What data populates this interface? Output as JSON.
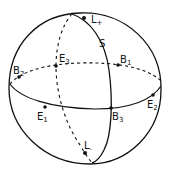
{
  "figure": {
    "line_color": "#111111",
    "background": "#ffffff"
  },
  "labels": {
    "L_plus": {
      "base": "L",
      "sub": "+"
    },
    "L_minus": {
      "base": "L",
      "sub": "-"
    },
    "S": {
      "base": "S",
      "sub": ""
    },
    "E1": {
      "base": "E",
      "sub": "1"
    },
    "E2": {
      "base": "E",
      "sub": "2"
    },
    "E3": {
      "base": "E",
      "sub": "3"
    },
    "B1": {
      "base": "B",
      "sub": "1"
    },
    "B2": {
      "base": "B",
      "sub": "2"
    },
    "B3": {
      "base": "B",
      "sub": "3"
    }
  }
}
